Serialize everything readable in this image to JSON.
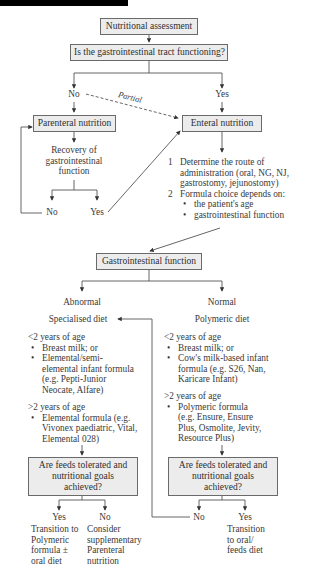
{
  "diagram": {
    "nodes": {
      "start": "Nutritional assessment",
      "gi_question": "Is the gastrointestinal tract functioning?",
      "no_label": "No",
      "partial_label": "Partial",
      "yes_label": "Yes",
      "parenteral": "Parenteral nutrition",
      "recovery": "Recovery of gastrointestinal function",
      "recovery_no": "No",
      "recovery_yes": "Yes",
      "enteral": "Enteral nutrition",
      "enteral_steps": [
        {
          "num": "1",
          "text": "Determine the route of administration (oral, NG, NJ, gastrostomy, jejunostomy)"
        },
        {
          "num": "2",
          "text": "Formula choice depends on:",
          "bullets": [
            "the patient's age",
            "gastrointestinal function"
          ]
        }
      ],
      "gi_function": "Gastrointestinal function",
      "abnormal": {
        "label": "Abnormal",
        "diet": "Specialised diet",
        "under2_heading": "<2 years of age",
        "under2_items": [
          "Breast milk; or",
          "Elemental/semi-elemental infant formula (e.g. Pepti-Junior Neocate, Alfare)"
        ],
        "over2_heading": ">2 years of age",
        "over2_items": [
          "Elemental formula (e.g. Vivonex paediatric, Vital, Elemental 028)"
        ],
        "question": "Are feeds tolerated and nutritional goals achieved?",
        "yes_label": "Yes",
        "no_label": "No",
        "yes_outcome": "Transition to Polymeric formula ± oral diet",
        "no_outcome": "Consider supplementary Parenteral nutrition"
      },
      "normal": {
        "label": "Normal",
        "diet": "Polymeric diet",
        "under2_heading": "<2 years of age",
        "under2_items": [
          "Breast milk; or",
          "Cow's milk-based infant formula (e.g. S26, Nan, Karicare Infant)"
        ],
        "over2_heading": ">2 years of age",
        "over2_items": [
          "Polymeric formula (e.g. Ensure, Ensure Plus, Osmolite, Jevity, Resource Plus)"
        ],
        "question": "Are feeds tolerated and nutritional goals achieved?",
        "no_label": "No",
        "yes_label": "Yes",
        "yes_outcome": "Transition to oral/ feeds diet"
      }
    },
    "colors": {
      "box_fill": "#ececec",
      "box_border": "#6a6a6a",
      "line": "#555555",
      "text": "#3a3a3a"
    }
  }
}
